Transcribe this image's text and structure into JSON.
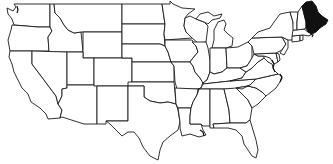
{
  "map": {
    "title": "",
    "region": "Contiguous United States",
    "style": "outline",
    "colors": {
      "background": "#ffffff",
      "border": "#1a1a1a",
      "default_fill": "#ffffff",
      "highlight_fill": "#111111"
    },
    "highlighted_states": [
      "Maine"
    ],
    "states": [
      "Washington",
      "Oregon",
      "California",
      "Idaho",
      "Nevada",
      "Montana",
      "Wyoming",
      "Utah",
      "Arizona",
      "Colorado",
      "New Mexico",
      "North Dakota",
      "South Dakota",
      "Nebraska",
      "Kansas",
      "Oklahoma",
      "Texas",
      "Minnesota",
      "Iowa",
      "Missouri",
      "Arkansas",
      "Louisiana",
      "Wisconsin",
      "Illinois",
      "Michigan",
      "Indiana",
      "Ohio",
      "Kentucky",
      "Tennessee",
      "Mississippi",
      "Alabama",
      "Georgia",
      "Florida",
      "South Carolina",
      "North Carolina",
      "Virginia",
      "West Virginia",
      "Maryland",
      "Delaware",
      "Pennsylvania",
      "New Jersey",
      "New York",
      "Connecticut",
      "Rhode Island",
      "Massachusetts",
      "Vermont",
      "New Hampshire",
      "Maine"
    ]
  }
}
